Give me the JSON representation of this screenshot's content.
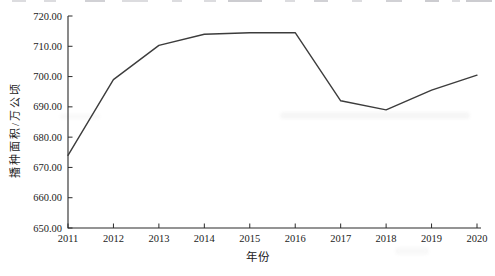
{
  "figure": {
    "background": "#ffffff",
    "line_color": "#3c3c3c",
    "axis_color": "#2b2b2b",
    "text_color": "#1c1c1c"
  },
  "chart_data": {
    "type": "line",
    "title": "",
    "xlabel": "年份",
    "ylabel": "播种面积/万公顷",
    "x": [
      2011,
      2012,
      2013,
      2014,
      2015,
      2016,
      2017,
      2018,
      2019,
      2020
    ],
    "x_tick_labels": [
      "2011",
      "2012",
      "2013",
      "2014",
      "2015",
      "2016",
      "2017",
      "2018",
      "2019",
      "2020"
    ],
    "values": [
      674.0,
      699.0,
      710.3,
      714.0,
      714.5,
      714.5,
      692.0,
      689.0,
      695.5,
      700.5
    ],
    "ylim": [
      650,
      720
    ],
    "ytick_step": 10,
    "y_tick_labels": [
      "650.00",
      "660.00",
      "670.00",
      "680.00",
      "690.00",
      "700.00",
      "710.00",
      "720.00"
    ],
    "grid": false,
    "legend": null,
    "series_name": "播种面积"
  }
}
